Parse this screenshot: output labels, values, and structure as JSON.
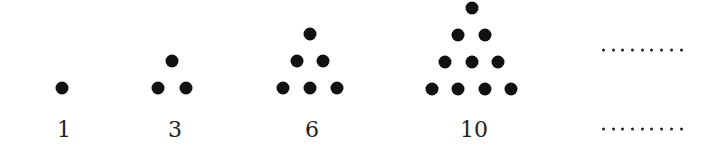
{
  "diagram": {
    "dot_color": "#111111",
    "figures": [
      {
        "label": "1",
        "label_x": 64,
        "dots": [
          [
            62,
            88
          ]
        ]
      },
      {
        "label": "3",
        "label_x": 175,
        "dots": [
          [
            172,
            61
          ],
          [
            158,
            88
          ],
          [
            186,
            88
          ]
        ]
      },
      {
        "label": "6",
        "label_x": 312,
        "dots": [
          [
            310,
            34
          ],
          [
            297,
            61
          ],
          [
            323,
            61
          ],
          [
            283,
            88
          ],
          [
            310,
            88
          ],
          [
            337,
            88
          ]
        ]
      },
      {
        "label": "10",
        "label_x": 474,
        "dots": [
          [
            472,
            8
          ],
          [
            458,
            35
          ],
          [
            485,
            35
          ],
          [
            445,
            62
          ],
          [
            472,
            62
          ],
          [
            498,
            62
          ],
          [
            432,
            89
          ],
          [
            458,
            89
          ],
          [
            485,
            89
          ],
          [
            511,
            89
          ]
        ]
      }
    ],
    "label_y": 129,
    "continuation": {
      "figure_ellipsis": "·········",
      "label_ellipsis": "·········",
      "x": 602,
      "figure_y": 50,
      "label_y": 129,
      "dot_count": 9
    }
  }
}
